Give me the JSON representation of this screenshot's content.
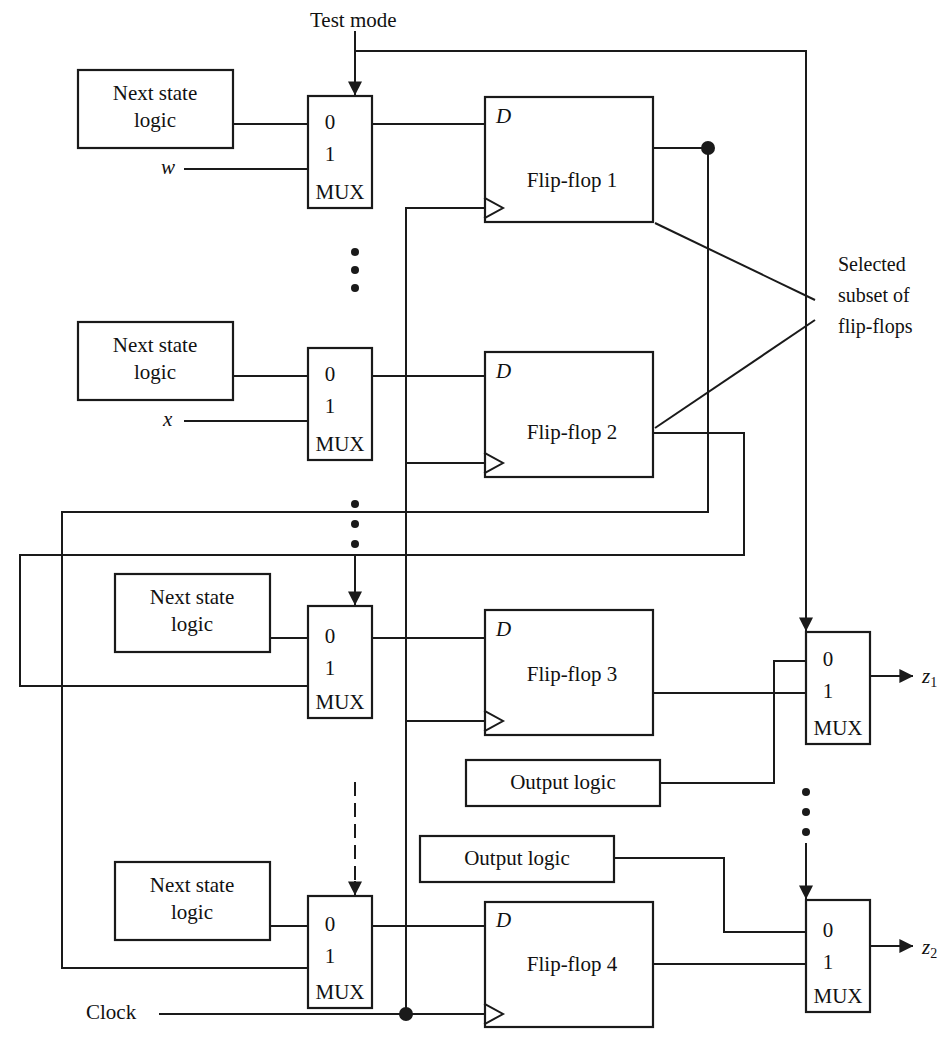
{
  "figure": {
    "domain": "diagram"
  },
  "labels": {
    "test_mode": "Test mode",
    "clock": "Clock",
    "selected_subset_line1": "Selected",
    "selected_subset_line2": "subset of",
    "selected_subset_line3": "flip-flops",
    "input_w": "w",
    "input_x": "x",
    "output_z1": "z",
    "output_z1_sub": "1",
    "output_z2": "z",
    "output_z2_sub": "2"
  },
  "next_state_logic_blocks": [
    {
      "id": "nsl1",
      "line1": "Next state",
      "line2": "logic"
    },
    {
      "id": "nsl2",
      "line1": "Next state",
      "line2": "logic"
    },
    {
      "id": "nsl3",
      "line1": "Next state",
      "line2": "logic"
    },
    {
      "id": "nsl4",
      "line1": "Next state",
      "line2": "logic"
    }
  ],
  "input_muxes": [
    {
      "id": "mux1",
      "in0": "0",
      "in1": "1",
      "name": "MUX",
      "data_input_label": "w"
    },
    {
      "id": "mux2",
      "in0": "0",
      "in1": "1",
      "name": "MUX",
      "data_input_label": "x"
    },
    {
      "id": "mux3",
      "in0": "0",
      "in1": "1",
      "name": "MUX",
      "data_input_label": ""
    },
    {
      "id": "mux4",
      "in0": "0",
      "in1": "1",
      "name": "MUX",
      "data_input_label": ""
    }
  ],
  "flip_flops": [
    {
      "id": "ff1",
      "label": "Flip-flop 1",
      "d_label": "D"
    },
    {
      "id": "ff2",
      "label": "Flip-flop 2",
      "d_label": "D"
    },
    {
      "id": "ff3",
      "label": "Flip-flop 3",
      "d_label": "D"
    },
    {
      "id": "ff4",
      "label": "Flip-flop 4",
      "d_label": "D"
    }
  ],
  "output_logic_blocks": [
    {
      "id": "ol1",
      "label": "Output logic"
    },
    {
      "id": "ol2",
      "label": "Output logic"
    }
  ],
  "output_muxes": [
    {
      "id": "omux1",
      "in0": "0",
      "in1": "1",
      "name": "MUX",
      "output": "z1"
    },
    {
      "id": "omux2",
      "in0": "0",
      "in1": "1",
      "name": "MUX",
      "output": "z2"
    }
  ],
  "colors": {
    "line": "#1a1a1a",
    "background": "#ffffff",
    "text": "#111111"
  }
}
